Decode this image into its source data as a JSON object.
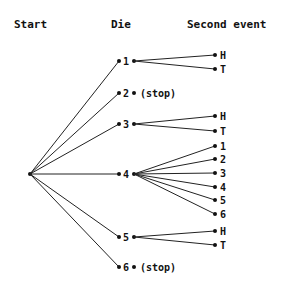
{
  "headers": {
    "start": "Start",
    "die": "Die",
    "second_event": "Second event"
  },
  "die_outcomes": [
    {
      "label": "1",
      "children": [
        "H",
        "T"
      ]
    },
    {
      "label": "2",
      "stop_label": "(stop)"
    },
    {
      "label": "3",
      "children": [
        "H",
        "T"
      ]
    },
    {
      "label": "4",
      "children": [
        "1",
        "2",
        "3",
        "4",
        "5",
        "6"
      ]
    },
    {
      "label": "5",
      "children": [
        "H",
        "T"
      ]
    },
    {
      "label": "6",
      "stop_label": "(stop)"
    }
  ],
  "colors": {
    "line": "#222222",
    "text": "#111111",
    "background": "#ffffff"
  }
}
